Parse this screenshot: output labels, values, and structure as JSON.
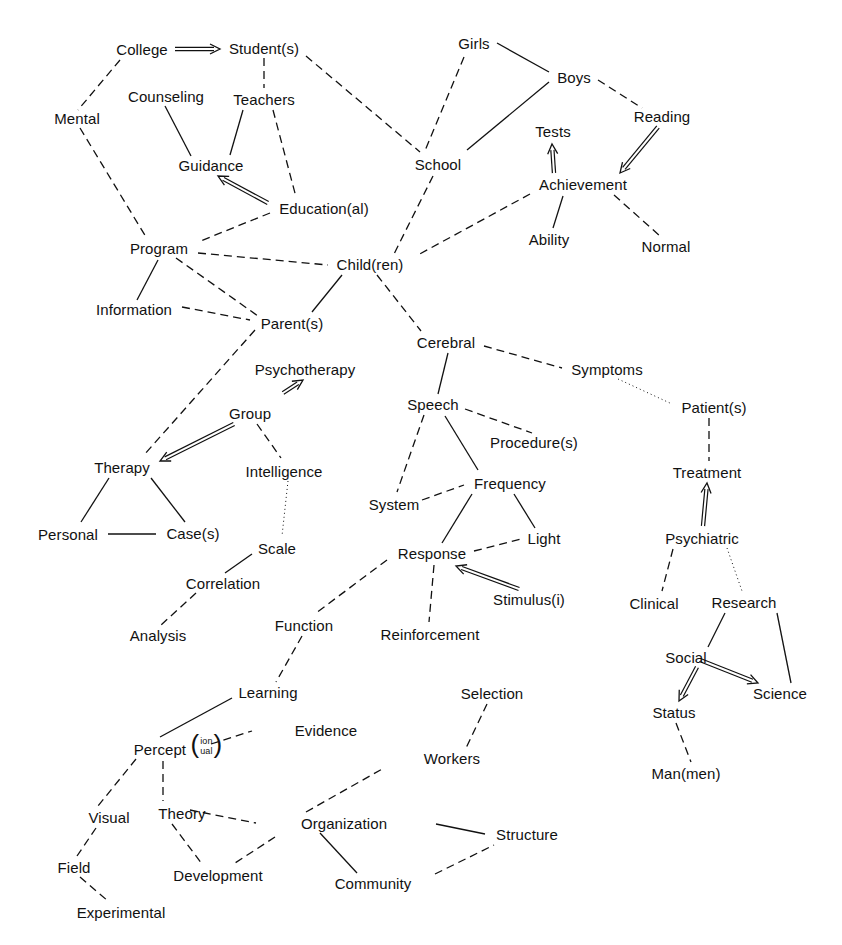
{
  "diagram": {
    "type": "semantic-network",
    "legend_styles": {
      "solid": "solid line",
      "dashed": "dashed line",
      "dotted": "dotted line",
      "arrow": "double-line arrow"
    },
    "nodes": [
      {
        "id": "college",
        "label": "College",
        "x": 142,
        "y": 49
      },
      {
        "id": "students",
        "label": "Student(s)",
        "x": 264,
        "y": 48
      },
      {
        "id": "mental",
        "label": "Mental",
        "x": 77,
        "y": 118
      },
      {
        "id": "counseling",
        "label": "Counseling",
        "x": 166,
        "y": 96
      },
      {
        "id": "teachers",
        "label": "Teachers",
        "x": 264,
        "y": 99
      },
      {
        "id": "guidance",
        "label": "Guidance",
        "x": 211,
        "y": 165
      },
      {
        "id": "educational",
        "label": "Education(al)",
        "x": 324,
        "y": 208
      },
      {
        "id": "program",
        "label": "Program",
        "x": 159,
        "y": 248
      },
      {
        "id": "children",
        "label": "Child(ren)",
        "x": 370,
        "y": 264
      },
      {
        "id": "information",
        "label": "Information",
        "x": 134,
        "y": 309
      },
      {
        "id": "parents",
        "label": "Parent(s)",
        "x": 292,
        "y": 323
      },
      {
        "id": "girls",
        "label": "Girls",
        "x": 474,
        "y": 43
      },
      {
        "id": "boys",
        "label": "Boys",
        "x": 574,
        "y": 77
      },
      {
        "id": "reading",
        "label": "Reading",
        "x": 662,
        "y": 116
      },
      {
        "id": "tests",
        "label": "Tests",
        "x": 553,
        "y": 131
      },
      {
        "id": "school",
        "label": "School",
        "x": 438,
        "y": 164
      },
      {
        "id": "achievement",
        "label": "Achievement",
        "x": 583,
        "y": 184
      },
      {
        "id": "ability",
        "label": "Ability",
        "x": 549,
        "y": 239
      },
      {
        "id": "normal",
        "label": "Normal",
        "x": 666,
        "y": 246
      },
      {
        "id": "cerebral",
        "label": "Cerebral",
        "x": 446,
        "y": 342
      },
      {
        "id": "symptoms",
        "label": "Symptoms",
        "x": 607,
        "y": 369
      },
      {
        "id": "psychotherapy",
        "label": "Psychotherapy",
        "x": 305,
        "y": 369
      },
      {
        "id": "group",
        "label": "Group",
        "x": 250,
        "y": 413
      },
      {
        "id": "speech",
        "label": "Speech",
        "x": 433,
        "y": 404
      },
      {
        "id": "patients",
        "label": "Patient(s)",
        "x": 714,
        "y": 407
      },
      {
        "id": "procedures",
        "label": "Procedure(s)",
        "x": 534,
        "y": 442
      },
      {
        "id": "therapy",
        "label": "Therapy",
        "x": 122,
        "y": 467
      },
      {
        "id": "intelligence",
        "label": "Intelligence",
        "x": 284,
        "y": 471
      },
      {
        "id": "treatment",
        "label": "Treatment",
        "x": 707,
        "y": 472
      },
      {
        "id": "frequency",
        "label": "Frequency",
        "x": 510,
        "y": 483
      },
      {
        "id": "system",
        "label": "System",
        "x": 394,
        "y": 504
      },
      {
        "id": "personal",
        "label": "Personal",
        "x": 68,
        "y": 534
      },
      {
        "id": "cases",
        "label": "Case(s)",
        "x": 193,
        "y": 533
      },
      {
        "id": "light",
        "label": "Light",
        "x": 544,
        "y": 538
      },
      {
        "id": "psychiatric",
        "label": "Psychiatric",
        "x": 702,
        "y": 538
      },
      {
        "id": "scale",
        "label": "Scale",
        "x": 277,
        "y": 548
      },
      {
        "id": "response",
        "label": "Response",
        "x": 432,
        "y": 553
      },
      {
        "id": "correlation",
        "label": "Correlation",
        "x": 223,
        "y": 583
      },
      {
        "id": "stimulus",
        "label": "Stimulus(i)",
        "x": 529,
        "y": 599
      },
      {
        "id": "clinical",
        "label": "Clinical",
        "x": 654,
        "y": 603
      },
      {
        "id": "research",
        "label": "Research",
        "x": 744,
        "y": 602
      },
      {
        "id": "analysis",
        "label": "Analysis",
        "x": 158,
        "y": 635
      },
      {
        "id": "function",
        "label": "Function",
        "x": 304,
        "y": 625
      },
      {
        "id": "reinforcement",
        "label": "Reinforcement",
        "x": 430,
        "y": 634
      },
      {
        "id": "social",
        "label": "Social",
        "x": 686,
        "y": 657
      },
      {
        "id": "science",
        "label": "Science",
        "x": 780,
        "y": 693
      },
      {
        "id": "learning",
        "label": "Learning",
        "x": 268,
        "y": 692
      },
      {
        "id": "selection",
        "label": "Selection",
        "x": 492,
        "y": 693
      },
      {
        "id": "status",
        "label": "Status",
        "x": 674,
        "y": 712
      },
      {
        "id": "evidence",
        "label": "Evidence",
        "x": 326,
        "y": 730
      },
      {
        "id": "perceptual",
        "label": "Percept",
        "sub_top": "ion",
        "sub_bottom": "ual",
        "x": 164,
        "y": 746
      },
      {
        "id": "workers",
        "label": "Workers",
        "x": 452,
        "y": 758
      },
      {
        "id": "manmen",
        "label": "Man(men)",
        "x": 686,
        "y": 773
      },
      {
        "id": "visual",
        "label": "Visual",
        "x": 109,
        "y": 817
      },
      {
        "id": "theory",
        "label": "Theory",
        "x": 182,
        "y": 813
      },
      {
        "id": "organization",
        "label": "Organization",
        "x": 344,
        "y": 823
      },
      {
        "id": "structure",
        "label": "Structure",
        "x": 527,
        "y": 834
      },
      {
        "id": "field",
        "label": "Field",
        "x": 74,
        "y": 867
      },
      {
        "id": "development",
        "label": "Development",
        "x": 218,
        "y": 875
      },
      {
        "id": "community",
        "label": "Community",
        "x": 373,
        "y": 883
      },
      {
        "id": "experimental",
        "label": "Experimental",
        "x": 121,
        "y": 912
      }
    ],
    "edges": [
      {
        "from": [
          175,
          49
        ],
        "to": [
          220,
          49
        ],
        "style": "arrow"
      },
      {
        "from": [
          120,
          60
        ],
        "to": [
          78,
          110
        ],
        "style": "dashed"
      },
      {
        "from": [
          80,
          128
        ],
        "to": [
          146,
          237
        ],
        "style": "dashed"
      },
      {
        "from": [
          264,
          58
        ],
        "to": [
          264,
          88
        ],
        "style": "dashed"
      },
      {
        "from": [
          306,
          56
        ],
        "to": [
          420,
          152
        ],
        "style": "dashed"
      },
      {
        "from": [
          165,
          106
        ],
        "to": [
          191,
          156
        ],
        "style": "solid"
      },
      {
        "from": [
          243,
          110
        ],
        "to": [
          230,
          155
        ],
        "style": "solid"
      },
      {
        "from": [
          273,
          110
        ],
        "to": [
          296,
          197
        ],
        "style": "dashed"
      },
      {
        "from": [
          268,
          203
        ],
        "to": [
          218,
          176
        ],
        "style": "arrow"
      },
      {
        "from": [
          270,
          213
        ],
        "to": [
          198,
          242
        ],
        "style": "dashed"
      },
      {
        "from": [
          198,
          253
        ],
        "to": [
          328,
          265
        ],
        "style": "dashed"
      },
      {
        "from": [
          158,
          260
        ],
        "to": [
          137,
          300
        ],
        "style": "solid"
      },
      {
        "from": [
          176,
          258
        ],
        "to": [
          258,
          316
        ],
        "style": "dashed"
      },
      {
        "from": [
          182,
          307
        ],
        "to": [
          250,
          320
        ],
        "style": "dashed"
      },
      {
        "from": [
          342,
          275
        ],
        "to": [
          312,
          312
        ],
        "style": "solid"
      },
      {
        "from": [
          255,
          330
        ],
        "to": [
          144,
          455
        ],
        "style": "dashed"
      },
      {
        "from": [
          464,
          57
        ],
        "to": [
          424,
          153
        ],
        "style": "dashed"
      },
      {
        "from": [
          497,
          43
        ],
        "to": [
          549,
          72
        ],
        "style": "solid"
      },
      {
        "from": [
          549,
          82
        ],
        "to": [
          467,
          150
        ],
        "style": "solid"
      },
      {
        "from": [
          598,
          80
        ],
        "to": [
          642,
          108
        ],
        "style": "dashed"
      },
      {
        "from": [
          433,
          176
        ],
        "to": [
          394,
          254
        ],
        "style": "dashed"
      },
      {
        "from": [
          658,
          127
        ],
        "to": [
          620,
          173
        ],
        "style": "arrow"
      },
      {
        "from": [
          554,
          173
        ],
        "to": [
          552,
          144
        ],
        "style": "arrow"
      },
      {
        "from": [
          530,
          194
        ],
        "to": [
          416,
          256
        ],
        "style": "dashed"
      },
      {
        "from": [
          563,
          196
        ],
        "to": [
          553,
          228
        ],
        "style": "solid"
      },
      {
        "from": [
          614,
          195
        ],
        "to": [
          660,
          236
        ],
        "style": "dashed"
      },
      {
        "from": [
          377,
          275
        ],
        "to": [
          421,
          331
        ],
        "style": "dashed"
      },
      {
        "from": [
          484,
          346
        ],
        "to": [
          562,
          368
        ],
        "style": "dashed"
      },
      {
        "from": [
          448,
          353
        ],
        "to": [
          438,
          394
        ],
        "style": "solid"
      },
      {
        "from": [
          618,
          379
        ],
        "to": [
          672,
          404
        ],
        "style": "dotted"
      },
      {
        "from": [
          465,
          409
        ],
        "to": [
          532,
          433
        ],
        "style": "dashed"
      },
      {
        "from": [
          424,
          415
        ],
        "to": [
          397,
          492
        ],
        "style": "dashed"
      },
      {
        "from": [
          445,
          416
        ],
        "to": [
          478,
          470
        ],
        "style": "solid"
      },
      {
        "from": [
          709,
          418
        ],
        "to": [
          709,
          461
        ],
        "style": "dashed"
      },
      {
        "from": [
          703,
          526
        ],
        "to": [
          707,
          483
        ],
        "style": "arrow"
      },
      {
        "from": [
          422,
          500
        ],
        "to": [
          464,
          485
        ],
        "style": "dashed"
      },
      {
        "from": [
          472,
          494
        ],
        "to": [
          442,
          543
        ],
        "style": "solid"
      },
      {
        "from": [
          514,
          494
        ],
        "to": [
          535,
          528
        ],
        "style": "solid"
      },
      {
        "from": [
          474,
          551
        ],
        "to": [
          521,
          539
        ],
        "style": "dashed"
      },
      {
        "from": [
          519,
          589
        ],
        "to": [
          456,
          566
        ],
        "style": "arrow"
      },
      {
        "from": [
          434,
          565
        ],
        "to": [
          429,
          622
        ],
        "style": "dashed"
      },
      {
        "from": [
          387,
          560
        ],
        "to": [
          316,
          613
        ],
        "style": "dashed"
      },
      {
        "from": [
          673,
          549
        ],
        "to": [
          662,
          591
        ],
        "style": "dashed"
      },
      {
        "from": [
          727,
          548
        ],
        "to": [
          742,
          591
        ],
        "style": "dotted"
      },
      {
        "from": [
          725,
          613
        ],
        "to": [
          708,
          647
        ],
        "style": "solid"
      },
      {
        "from": [
          777,
          613
        ],
        "to": [
          791,
          683
        ],
        "style": "solid"
      },
      {
        "from": [
          700,
          660
        ],
        "to": [
          758,
          683
        ],
        "style": "arrow"
      },
      {
        "from": [
          697,
          667
        ],
        "to": [
          679,
          701
        ],
        "style": "arrow"
      },
      {
        "from": [
          676,
          723
        ],
        "to": [
          691,
          762
        ],
        "style": "dashed"
      },
      {
        "from": [
          283,
          393
        ],
        "to": [
          303,
          380
        ],
        "style": "arrow"
      },
      {
        "from": [
          234,
          424
        ],
        "to": [
          160,
          461
        ],
        "style": "arrow"
      },
      {
        "from": [
          257,
          424
        ],
        "to": [
          281,
          458
        ],
        "style": "dashed"
      },
      {
        "from": [
          288,
          481
        ],
        "to": [
          282,
          536
        ],
        "style": "dotted"
      },
      {
        "from": [
          109,
          478
        ],
        "to": [
          81,
          522
        ],
        "style": "solid"
      },
      {
        "from": [
          151,
          478
        ],
        "to": [
          185,
          522
        ],
        "style": "solid"
      },
      {
        "from": [
          108,
          534
        ],
        "to": [
          156,
          534
        ],
        "style": "solid"
      },
      {
        "from": [
          252,
          554
        ],
        "to": [
          225,
          573
        ],
        "style": "solid"
      },
      {
        "from": [
          196,
          593
        ],
        "to": [
          161,
          625
        ],
        "style": "dashed"
      },
      {
        "from": [
          302,
          636
        ],
        "to": [
          276,
          682
        ],
        "style": "dashed"
      },
      {
        "from": [
          232,
          698
        ],
        "to": [
          160,
          737
        ],
        "style": "solid"
      },
      {
        "from": [
          211,
          744
        ],
        "to": [
          252,
          731
        ],
        "style": "dashed"
      },
      {
        "from": [
          136,
          759
        ],
        "to": [
          98,
          806
        ],
        "style": "dashed"
      },
      {
        "from": [
          163,
          761
        ],
        "to": [
          163,
          801
        ],
        "style": "dashed"
      },
      {
        "from": [
          96,
          828
        ],
        "to": [
          77,
          856
        ],
        "style": "dashed"
      },
      {
        "from": [
          80,
          877
        ],
        "to": [
          108,
          901
        ],
        "style": "dashed"
      },
      {
        "from": [
          190,
          810
        ],
        "to": [
          256,
          823
        ],
        "style": "dashed"
      },
      {
        "from": [
          172,
          824
        ],
        "to": [
          202,
          864
        ],
        "style": "solid-dashed"
      },
      {
        "from": [
          275,
          837
        ],
        "to": [
          232,
          865
        ],
        "style": "dashed"
      },
      {
        "from": [
          306,
          812
        ],
        "to": [
          384,
          768
        ],
        "style": "dashed"
      },
      {
        "from": [
          487,
          704
        ],
        "to": [
          466,
          748
        ],
        "style": "dashed"
      },
      {
        "from": [
          348,
          823
        ],
        "to": [
          484,
          833
        ],
        "style": "solid-offset"
      },
      {
        "from": [
          320,
          833
        ],
        "to": [
          357,
          873
        ],
        "style": "solid"
      },
      {
        "from": [
          436,
          824
        ],
        "to": [
          485,
          834
        ],
        "style": "solid"
      },
      {
        "from": [
          435,
          874
        ],
        "to": [
          494,
          845
        ],
        "style": "dashed"
      }
    ]
  }
}
